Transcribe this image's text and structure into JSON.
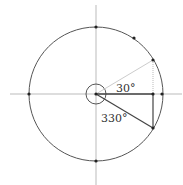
{
  "diagram": {
    "type": "unit-circle",
    "labels": {
      "angle_30": "30°",
      "angle_330": "330°"
    },
    "angles_deg": [
      30,
      330
    ],
    "marked_points_deg": [
      0,
      30,
      60,
      90,
      180,
      270,
      330
    ],
    "colors": {
      "circle": "#555555",
      "axes": "#bbbbbb",
      "radius_30": "#cccccc",
      "radius_330": "#444444",
      "points": "#222222"
    }
  }
}
